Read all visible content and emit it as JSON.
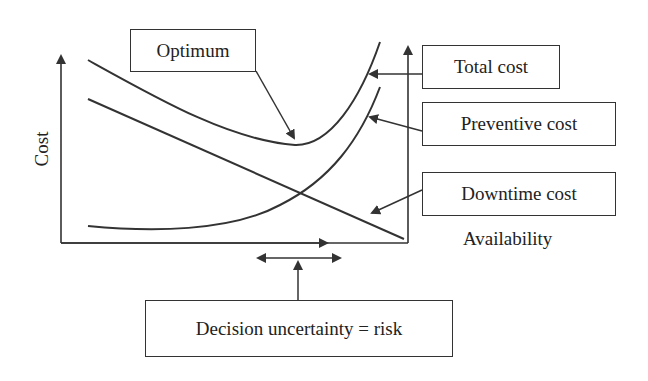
{
  "diagram": {
    "axes": {
      "y_label": "Cost",
      "x_label": "Availability"
    },
    "curves": [
      {
        "name": "Total cost",
        "shape": "U-shaped, decreasing then rising steeply"
      },
      {
        "name": "Preventive cost",
        "shape": "flat low then rising steeply"
      },
      {
        "name": "Downtime cost",
        "shape": "straight line decreasing"
      }
    ],
    "labels": {
      "optimum": "Optimum",
      "total_cost": "Total cost",
      "preventive_cost": "Preventive cost",
      "downtime_cost": "Downtime cost",
      "availability": "Availability",
      "cost": "Cost",
      "risk": "Decision uncertainty = risk"
    }
  },
  "colors": {
    "line": "#333333",
    "background": "#ffffff"
  }
}
